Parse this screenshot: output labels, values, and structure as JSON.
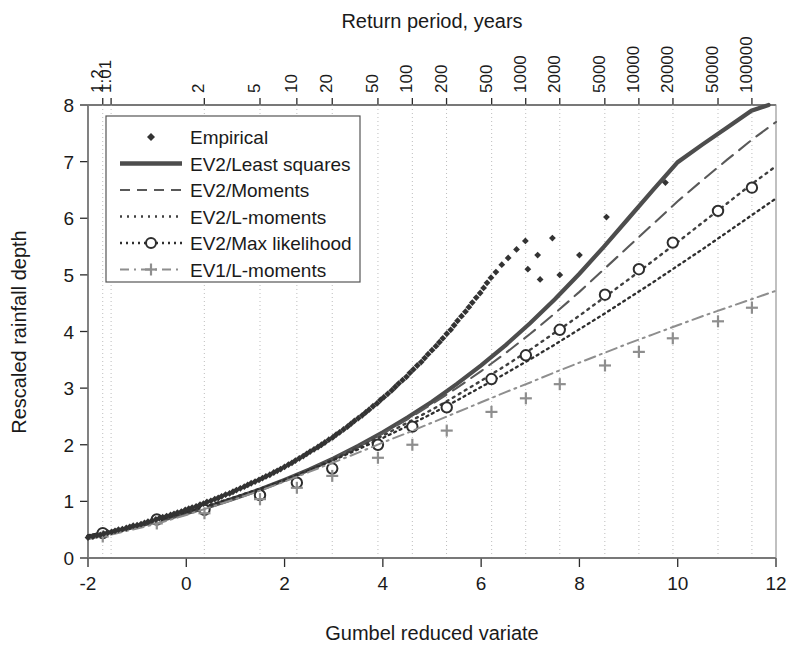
{
  "chart_data": {
    "type": "line",
    "title": "",
    "xlabel": "Gumbel reduced variate",
    "ylabel": "Rescaled rainfall depth",
    "top_axis_label": "Return period, years",
    "xlim": [
      -2,
      12
    ],
    "ylim": [
      0,
      8
    ],
    "xticks": [
      -2,
      0,
      2,
      4,
      6,
      8,
      10,
      12
    ],
    "xtick_labels": [
      "-2",
      "0",
      "2",
      "4",
      "6",
      "8",
      "10",
      "12"
    ],
    "yticks": [
      0,
      1,
      2,
      3,
      4,
      5,
      6,
      7,
      8
    ],
    "ytick_labels": [
      "0",
      "1",
      "2",
      "3",
      "4",
      "5",
      "6",
      "7",
      "8"
    ],
    "grid": true,
    "grid_axis": "x",
    "top_axis": {
      "label": "Return period, years",
      "tick_labels": [
        "1.01",
        "1.2",
        "2",
        "5",
        "10",
        "20",
        "50",
        "100",
        "200",
        "500",
        "1000",
        "2000",
        "5000",
        "10000",
        "20000",
        "50000",
        "100000"
      ],
      "tick_return_periods": [
        1.01,
        1.2,
        2,
        5,
        10,
        20,
        50,
        100,
        200,
        500,
        1000,
        2000,
        5000,
        10000,
        20000,
        50000,
        100000
      ],
      "tick_x_values": [
        -1.53,
        -1.7,
        0.367,
        1.5,
        2.25,
        2.97,
        3.9,
        4.6,
        5.296,
        6.214,
        6.907,
        7.6,
        8.517,
        9.21,
        9.903,
        10.82,
        11.51
      ]
    },
    "legend": {
      "position": "upper-left",
      "entries": [
        {
          "label": "Empirical",
          "style": "marker",
          "marker": "diamond",
          "color": "#3a3a3a"
        },
        {
          "label": "EV2/Least squares",
          "style": "solid",
          "color": "#4a4a4a"
        },
        {
          "label": "EV2/Moments",
          "style": "dashed",
          "color": "#5a5a5a"
        },
        {
          "label": "EV2/L-moments",
          "style": "dotted",
          "color": "#4a4a4a"
        },
        {
          "label": "EV2/Max likelihood",
          "style": "dashdot-marker",
          "marker": "circle",
          "color": "#2e2e2e"
        },
        {
          "label": "EV1/L-moments",
          "style": "dashdot-plus",
          "marker": "plus",
          "color": "#8a8a8a"
        }
      ]
    },
    "series": [
      {
        "name": "EV2/Least squares",
        "style": "solid",
        "x": [
          -2,
          -1.5,
          -1,
          -0.5,
          0,
          0.5,
          1,
          1.5,
          2,
          2.5,
          3,
          3.5,
          4,
          4.5,
          5,
          5.5,
          6,
          6.5,
          7,
          7.5,
          8,
          8.5,
          9,
          9.5,
          10,
          10.5,
          11,
          11.5,
          11.85
        ],
        "y": [
          0.38,
          0.46,
          0.56,
          0.67,
          0.79,
          0.92,
          1.06,
          1.21,
          1.38,
          1.56,
          1.76,
          1.98,
          2.22,
          2.48,
          2.76,
          3.07,
          3.4,
          3.76,
          4.15,
          4.57,
          5.02,
          5.5,
          6.0,
          6.5,
          6.99,
          7.3,
          7.6,
          7.9,
          8.0
        ]
      },
      {
        "name": "EV2/Moments",
        "style": "dashed",
        "x": [
          -2,
          -1.5,
          -1,
          -0.5,
          0,
          0.5,
          1,
          1.5,
          2,
          2.5,
          3,
          3.5,
          4,
          4.5,
          5,
          5.5,
          6,
          6.5,
          7,
          7.5,
          8,
          8.5,
          9,
          9.5,
          10,
          10.5,
          11,
          11.5,
          12
        ],
        "y": [
          0.38,
          0.46,
          0.56,
          0.67,
          0.79,
          0.92,
          1.06,
          1.21,
          1.38,
          1.56,
          1.76,
          1.97,
          2.2,
          2.45,
          2.72,
          3.0,
          3.3,
          3.62,
          3.96,
          4.32,
          4.7,
          5.1,
          5.5,
          5.9,
          6.3,
          6.67,
          7.03,
          7.38,
          7.7
        ]
      },
      {
        "name": "EV2/L-moments",
        "style": "dotted",
        "x": [
          -2,
          -1.5,
          -1,
          -0.5,
          0,
          0.5,
          1,
          1.5,
          2,
          2.5,
          3,
          3.5,
          4,
          4.5,
          5,
          5.5,
          6,
          6.5,
          7,
          7.5,
          8,
          8.5,
          9,
          9.5,
          10,
          10.5,
          11,
          11.5,
          12
        ],
        "y": [
          0.39,
          0.47,
          0.57,
          0.68,
          0.8,
          0.93,
          1.07,
          1.22,
          1.38,
          1.56,
          1.75,
          1.95,
          2.16,
          2.39,
          2.62,
          2.87,
          3.13,
          3.4,
          3.68,
          3.98,
          4.28,
          4.6,
          4.92,
          5.25,
          5.58,
          5.92,
          6.26,
          6.6,
          6.92
        ]
      },
      {
        "name": "EV2/Max likelihood",
        "style": "dashdot",
        "marker": "circle",
        "x": [
          -2,
          -1.5,
          -1,
          -0.5,
          0,
          0.5,
          1,
          1.5,
          2,
          2.5,
          3,
          3.5,
          4,
          4.5,
          5,
          5.5,
          6,
          6.5,
          7,
          7.5,
          8,
          8.5,
          9,
          9.5,
          10,
          10.5,
          11,
          11.5,
          12
        ],
        "y": [
          0.4,
          0.48,
          0.58,
          0.69,
          0.81,
          0.94,
          1.08,
          1.22,
          1.38,
          1.55,
          1.73,
          1.92,
          2.12,
          2.33,
          2.55,
          2.78,
          3.02,
          3.26,
          3.51,
          3.77,
          4.04,
          4.31,
          4.59,
          4.87,
          5.16,
          5.45,
          5.75,
          6.05,
          6.35
        ],
        "marker_x": [
          -1.7,
          -0.6,
          0.37,
          1.5,
          2.25,
          2.97,
          3.9,
          4.6,
          5.3,
          6.21,
          6.91,
          7.6,
          8.52,
          9.21,
          9.9,
          10.82,
          11.51
        ],
        "marker_y": [
          0.44,
          0.68,
          0.85,
          1.11,
          1.33,
          1.58,
          2.0,
          2.32,
          2.66,
          3.16,
          3.58,
          4.03,
          4.65,
          5.1,
          5.57,
          6.13,
          6.54
        ]
      },
      {
        "name": "EV1/L-moments",
        "style": "dashdotdot",
        "marker": "plus",
        "x": [
          -2,
          -1.5,
          -1,
          -0.5,
          0,
          0.5,
          1,
          1.5,
          2,
          2.5,
          3,
          3.5,
          4,
          4.5,
          5,
          5.5,
          6,
          6.5,
          7,
          7.5,
          8,
          8.5,
          9,
          9.5,
          10,
          10.5,
          11,
          11.5,
          12
        ],
        "y": [
          0.33,
          0.42,
          0.52,
          0.63,
          0.76,
          0.9,
          1.04,
          1.19,
          1.35,
          1.52,
          1.69,
          1.86,
          2.04,
          2.21,
          2.39,
          2.57,
          2.75,
          2.93,
          3.1,
          3.28,
          3.45,
          3.62,
          3.79,
          3.95,
          4.11,
          4.27,
          4.42,
          4.57,
          4.72
        ],
        "marker_x": [
          -1.7,
          -0.6,
          0.37,
          1.5,
          2.25,
          2.97,
          3.9,
          4.6,
          5.3,
          6.21,
          6.91,
          7.6,
          8.52,
          9.21,
          9.9,
          10.82,
          11.51
        ],
        "marker_y": [
          0.38,
          0.61,
          0.79,
          1.04,
          1.24,
          1.45,
          1.77,
          2.0,
          2.25,
          2.58,
          2.82,
          3.07,
          3.4,
          3.64,
          3.88,
          4.18,
          4.42
        ]
      }
    ],
    "empirical": {
      "name": "Empirical",
      "marker": "diamond",
      "points": [
        [
          -2.0,
          0.36
        ],
        [
          -1.9,
          0.38
        ],
        [
          -1.82,
          0.4
        ],
        [
          -1.75,
          0.41
        ],
        [
          -1.68,
          0.43
        ],
        [
          -1.6,
          0.45
        ],
        [
          -1.52,
          0.46
        ],
        [
          -1.45,
          0.48
        ],
        [
          -1.38,
          0.5
        ],
        [
          -1.3,
          0.51
        ],
        [
          -1.22,
          0.53
        ],
        [
          -1.15,
          0.55
        ],
        [
          -1.08,
          0.57
        ],
        [
          -1.0,
          0.58
        ],
        [
          -0.92,
          0.6
        ],
        [
          -0.85,
          0.62
        ],
        [
          -0.78,
          0.64
        ],
        [
          -0.7,
          0.66
        ],
        [
          -0.62,
          0.68
        ],
        [
          -0.55,
          0.7
        ],
        [
          -0.48,
          0.72
        ],
        [
          -0.4,
          0.74
        ],
        [
          -0.32,
          0.76
        ],
        [
          -0.25,
          0.78
        ],
        [
          -0.18,
          0.8
        ],
        [
          -0.1,
          0.82
        ],
        [
          -0.02,
          0.85
        ],
        [
          0.05,
          0.87
        ],
        [
          0.12,
          0.89
        ],
        [
          0.2,
          0.91
        ],
        [
          0.28,
          0.94
        ],
        [
          0.35,
          0.96
        ],
        [
          0.42,
          0.99
        ],
        [
          0.5,
          1.01
        ],
        [
          0.58,
          1.04
        ],
        [
          0.65,
          1.06
        ],
        [
          0.72,
          1.09
        ],
        [
          0.8,
          1.12
        ],
        [
          0.88,
          1.14
        ],
        [
          0.95,
          1.17
        ],
        [
          1.02,
          1.2
        ],
        [
          1.1,
          1.23
        ],
        [
          1.18,
          1.26
        ],
        [
          1.25,
          1.29
        ],
        [
          1.32,
          1.32
        ],
        [
          1.4,
          1.35
        ],
        [
          1.48,
          1.38
        ],
        [
          1.55,
          1.41
        ],
        [
          1.62,
          1.44
        ],
        [
          1.7,
          1.47
        ],
        [
          1.78,
          1.51
        ],
        [
          1.85,
          1.54
        ],
        [
          1.92,
          1.57
        ],
        [
          2.0,
          1.61
        ],
        [
          2.08,
          1.65
        ],
        [
          2.15,
          1.68
        ],
        [
          2.22,
          1.72
        ],
        [
          2.3,
          1.76
        ],
        [
          2.38,
          1.8
        ],
        [
          2.45,
          1.84
        ],
        [
          2.52,
          1.88
        ],
        [
          2.6,
          1.92
        ],
        [
          2.68,
          1.96
        ],
        [
          2.75,
          2.0
        ],
        [
          2.82,
          2.04
        ],
        [
          2.9,
          2.09
        ],
        [
          2.98,
          2.13
        ],
        [
          3.05,
          2.18
        ],
        [
          3.12,
          2.22
        ],
        [
          3.2,
          2.27
        ],
        [
          3.28,
          2.32
        ],
        [
          3.35,
          2.37
        ],
        [
          3.42,
          2.42
        ],
        [
          3.5,
          2.47
        ],
        [
          3.58,
          2.52
        ],
        [
          3.65,
          2.57
        ],
        [
          3.72,
          2.62
        ],
        [
          3.8,
          2.68
        ],
        [
          3.88,
          2.73
        ],
        [
          3.95,
          2.79
        ],
        [
          4.02,
          2.84
        ],
        [
          4.1,
          2.9
        ],
        [
          4.18,
          2.96
        ],
        [
          4.25,
          3.02
        ],
        [
          4.32,
          3.08
        ],
        [
          4.4,
          3.14
        ],
        [
          4.48,
          3.2
        ],
        [
          4.55,
          3.27
        ],
        [
          4.62,
          3.33
        ],
        [
          4.7,
          3.4
        ],
        [
          4.78,
          3.46
        ],
        [
          4.85,
          3.53
        ],
        [
          4.92,
          3.6
        ],
        [
          5.0,
          3.67
        ],
        [
          5.08,
          3.74
        ],
        [
          5.15,
          3.81
        ],
        [
          5.22,
          3.88
        ],
        [
          5.3,
          3.96
        ],
        [
          5.38,
          4.03
        ],
        [
          5.45,
          4.11
        ],
        [
          5.52,
          4.19
        ],
        [
          5.6,
          4.27
        ],
        [
          5.68,
          4.35
        ],
        [
          5.75,
          4.43
        ],
        [
          5.82,
          4.51
        ],
        [
          5.9,
          4.6
        ],
        [
          5.98,
          4.68
        ],
        [
          6.05,
          4.77
        ],
        [
          6.12,
          4.86
        ],
        [
          6.2,
          4.95
        ],
        [
          6.3,
          5.05
        ],
        [
          6.42,
          5.18
        ],
        [
          6.55,
          5.3
        ],
        [
          6.72,
          5.45
        ],
        [
          6.9,
          5.6
        ],
        [
          6.95,
          5.1
        ],
        [
          7.15,
          5.35
        ],
        [
          7.2,
          4.92
        ],
        [
          7.45,
          5.65
        ],
        [
          7.6,
          5.0
        ],
        [
          8.0,
          5.35
        ],
        [
          8.55,
          6.02
        ],
        [
          9.75,
          6.63
        ]
      ]
    }
  }
}
